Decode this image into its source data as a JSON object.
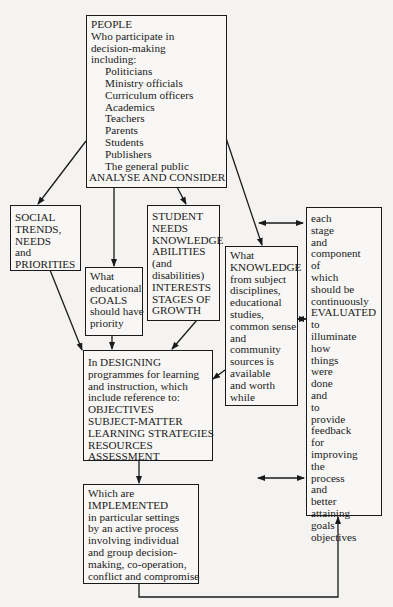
{
  "diagram": {
    "people": {
      "title": "PEOPLE",
      "intro": [
        "Who participate in",
        "decision-making",
        "including:"
      ],
      "participants": [
        "Politicians",
        "Ministry officials",
        "Curriculum officers",
        "Academics",
        "Teachers",
        "Parents",
        "Students",
        "Publishers",
        "The general public"
      ],
      "action": "ANALYSE AND CONSIDER"
    },
    "social": {
      "lines": [
        "SOCIAL",
        "TRENDS,",
        "NEEDS",
        "and",
        "PRIORITIES"
      ]
    },
    "goals": {
      "lines": [
        "What",
        "educational",
        "GOALS",
        "should have",
        "priority"
      ]
    },
    "student": {
      "lines": [
        "STUDENT",
        "NEEDS",
        "KNOWLEDGE",
        "ABILITIES",
        "(and",
        "disabilities)",
        "INTERESTS",
        "STAGES OF",
        "GROWTH"
      ]
    },
    "knowledge": {
      "lines": [
        "What",
        "KNOWLEDGE",
        "from subject",
        "disciplines,",
        "educational",
        "studies,",
        "common sense",
        "and",
        "community",
        "sources is",
        "available",
        "and worth",
        "while"
      ]
    },
    "evaluated": {
      "lines": [
        "each",
        "stage",
        "and",
        "component",
        "of",
        "which",
        "should be",
        "continuously",
        "EVALUATED",
        "to",
        "illuminate",
        "how",
        "things",
        "were",
        "done",
        "and",
        "to",
        "provide",
        "feedback",
        "for",
        "improving",
        "the",
        "process",
        "and",
        "better",
        "attaining",
        "goals",
        "objectives"
      ]
    },
    "designing": {
      "lines": [
        "In DESIGNING",
        "programmes for learning",
        "and instruction, which",
        "include reference to:",
        "OBJECTIVES",
        "SUBJECT-MATTER",
        "LEARNING STRATEGIES",
        "RESOURCES",
        "ASSESSMENT"
      ]
    },
    "implemented": {
      "lines": [
        "Which are",
        "IMPLEMENTED",
        "in particular settings",
        "by an active process",
        "involving individual",
        "and group decision-",
        "making, co-operation,",
        "conflict and compromise"
      ]
    }
  }
}
